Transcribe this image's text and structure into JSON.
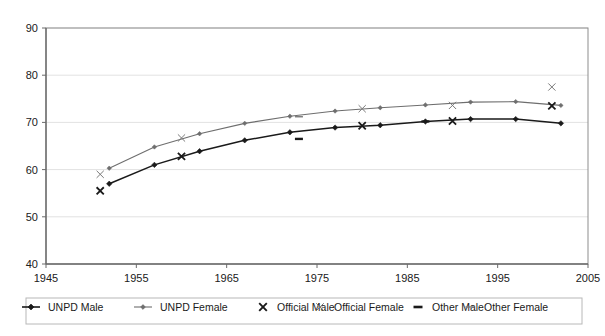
{
  "chart_data": {
    "type": "line",
    "title": "",
    "xlabel": "",
    "ylabel": "",
    "xlim": [
      1945,
      2005
    ],
    "ylim": [
      40,
      90
    ],
    "xticks": [
      1945,
      1955,
      1965,
      1975,
      1985,
      1995,
      2005
    ],
    "yticks": [
      40,
      50,
      60,
      70,
      80,
      90
    ],
    "grid": "horizontal",
    "legend_position": "bottom",
    "series": [
      {
        "name": "UNPD Male",
        "marker": "diamond",
        "color": "#1a1a1a",
        "style": "line-marker",
        "x": [
          1952,
          1957,
          1962,
          1967,
          1972,
          1977,
          1982,
          1987,
          1992,
          1997,
          2002
        ],
        "values": [
          57.0,
          61.0,
          63.9,
          66.2,
          67.9,
          68.9,
          69.4,
          70.2,
          70.7,
          70.7,
          69.8
        ]
      },
      {
        "name": "UNPD Female",
        "marker": "diamond",
        "color": "#6e6e6e",
        "style": "line-marker",
        "x": [
          1952,
          1957,
          1962,
          1967,
          1972,
          1977,
          1982,
          1987,
          1992,
          1997,
          2002
        ],
        "values": [
          60.3,
          64.8,
          67.6,
          69.8,
          71.3,
          72.4,
          73.1,
          73.7,
          74.3,
          74.4,
          73.6
        ]
      },
      {
        "name": "Official Male",
        "marker": "x-bold",
        "color": "#1a1a1a",
        "style": "marker-only",
        "x": [
          1951,
          1960,
          1980,
          1990,
          2001
        ],
        "values": [
          55.5,
          62.8,
          69.3,
          70.3,
          73.5
        ]
      },
      {
        "name": "Official Female",
        "marker": "x-thin",
        "color": "#7a7a7a",
        "style": "marker-only",
        "x": [
          1951,
          1960,
          1980,
          1990,
          2001
        ],
        "values": [
          59.0,
          66.7,
          72.9,
          73.6,
          77.5
        ]
      },
      {
        "name": "Other Male",
        "marker": "dash-bold",
        "color": "#1a1a1a",
        "style": "marker-only",
        "x": [
          1973,
          1987
        ],
        "values": [
          66.5,
          70.2
        ]
      },
      {
        "name": "Other Female",
        "marker": "dash-thin",
        "color": "#7a7a7a",
        "style": "marker-only",
        "x": [
          1973
        ],
        "values": [
          71.2
        ]
      }
    ],
    "legend": [
      {
        "label": "UNPD Male",
        "marker": "line-diamond-bold",
        "color": "#1a1a1a"
      },
      {
        "label": "UNPD Female",
        "marker": "line-diamond-thin",
        "color": "#6e6e6e"
      },
      {
        "label": "Official Male",
        "marker": "x-bold",
        "color": "#1a1a1a"
      },
      {
        "label": "Official Female",
        "marker": "x-thin",
        "color": "#7a7a7a"
      },
      {
        "label": "Other Male",
        "marker": "dash-bold",
        "color": "#1a1a1a"
      },
      {
        "label": "Other Female",
        "marker": "dash-thin",
        "color": "#7a7a7a"
      }
    ]
  },
  "axis": {
    "y_labels": [
      "90",
      "80",
      "70",
      "60",
      "50",
      "40"
    ],
    "x_labels": [
      "1945",
      "1955",
      "1965",
      "1975",
      "1985",
      "1995",
      "2005"
    ]
  },
  "legend": {
    "items": [
      {
        "label": "UNPD Male"
      },
      {
        "label": "UNPD Female"
      },
      {
        "label": "Official Male"
      },
      {
        "label": "Official Female"
      },
      {
        "label": "Other Male"
      },
      {
        "label": "Other Female"
      }
    ]
  },
  "colors": {
    "axis": "#6b6b6b",
    "grid": "#e2e2e2",
    "male_series": "#1a1a1a",
    "female_series": "#6e6e6e",
    "background": "#ffffff"
  }
}
